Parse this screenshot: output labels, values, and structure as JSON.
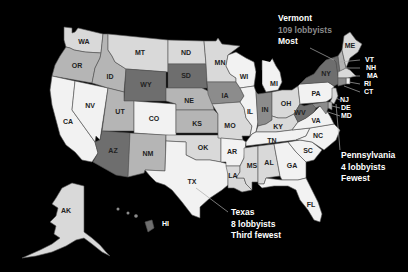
{
  "map": {
    "type": "choropleth",
    "region": "United States",
    "metric": "lobbyists per state",
    "colors": {
      "background": "#000000",
      "lightest": "#f2f2f2",
      "light": "#d9d9d9",
      "medium": "#b5b5b5",
      "dark": "#8c8c8c",
      "darkest": "#6e6e6e",
      "outline": "#555555"
    },
    "states": {
      "WA": {
        "label": "WA",
        "shade": "light"
      },
      "OR": {
        "label": "OR",
        "shade": "medium"
      },
      "CA": {
        "label": "CA",
        "shade": "lightest"
      },
      "NV": {
        "label": "NV",
        "shade": "lightest"
      },
      "ID": {
        "label": "ID",
        "shade": "medium"
      },
      "MT": {
        "label": "MT",
        "shade": "light"
      },
      "WY": {
        "label": "WY",
        "shade": "darkest"
      },
      "UT": {
        "label": "UT",
        "shade": "medium"
      },
      "CO": {
        "label": "CO",
        "shade": "lightest"
      },
      "AZ": {
        "label": "AZ",
        "shade": "darkest"
      },
      "NM": {
        "label": "NM",
        "shade": "medium"
      },
      "ND": {
        "label": "ND",
        "shade": "light"
      },
      "SD": {
        "label": "SD",
        "shade": "darkest"
      },
      "NE": {
        "label": "NE",
        "shade": "medium"
      },
      "KS": {
        "label": "KS",
        "shade": "medium"
      },
      "OK": {
        "label": "OK",
        "shade": "light"
      },
      "TX": {
        "label": "TX",
        "shade": "lightest"
      },
      "MN": {
        "label": "MN",
        "shade": "light"
      },
      "IA": {
        "label": "IA",
        "shade": "dark"
      },
      "MO": {
        "label": "MO",
        "shade": "light"
      },
      "AR": {
        "label": "AR",
        "shade": "lightest"
      },
      "LA": {
        "label": "LA",
        "shade": "light"
      },
      "WI": {
        "label": "WI",
        "shade": "lightest"
      },
      "IL": {
        "label": "IL",
        "shade": "lightest"
      },
      "MS": {
        "label": "MS",
        "shade": "light"
      },
      "MI": {
        "label": "MI",
        "shade": "lightest"
      },
      "IN": {
        "label": "IN",
        "shade": "dark"
      },
      "OH": {
        "label": "OH",
        "shade": "light"
      },
      "KY": {
        "label": "KY",
        "shade": "light"
      },
      "TN": {
        "label": "TN",
        "shade": "lightest"
      },
      "AL": {
        "label": "AL",
        "shade": "light"
      },
      "GA": {
        "label": "GA",
        "shade": "lightest"
      },
      "FL": {
        "label": "FL",
        "shade": "lightest"
      },
      "SC": {
        "label": "SC",
        "shade": "lightest"
      },
      "NC": {
        "label": "NC",
        "shade": "lightest"
      },
      "VA": {
        "label": "VA",
        "shade": "lightest"
      },
      "WV": {
        "label": "WV",
        "shade": "darkest"
      },
      "PA": {
        "label": "PA",
        "shade": "lightest"
      },
      "NY": {
        "label": "NY",
        "shade": "darkest"
      },
      "ME": {
        "label": "ME",
        "shade": "light"
      },
      "VT": {
        "label": "VT",
        "shade": "darkest"
      },
      "NH": {
        "label": "NH",
        "shade": "medium"
      },
      "MA": {
        "label": "MA",
        "shade": "light"
      },
      "RI": {
        "label": "RI",
        "shade": "lightest"
      },
      "CT": {
        "label": "CT",
        "shade": "dark"
      },
      "NJ": {
        "label": "NJ",
        "shade": "light"
      },
      "DE": {
        "label": "DE",
        "shade": "medium"
      },
      "MD": {
        "label": "MD",
        "shade": "dark"
      },
      "AK": {
        "label": "AK",
        "shade": "light"
      },
      "HI": {
        "label": "HI",
        "shade": "darkest"
      }
    },
    "annotations": [
      {
        "id": "vermont",
        "state": "Vermont",
        "count": "109 lobbyists",
        "rank": "Most"
      },
      {
        "id": "pennsylvania",
        "state": "Pennsylvania",
        "count": "4 lobbyists",
        "rank": "Fewest"
      },
      {
        "id": "texas",
        "state": "Texas",
        "count": "8 lobbyists",
        "rank": "Third fewest"
      }
    ]
  }
}
